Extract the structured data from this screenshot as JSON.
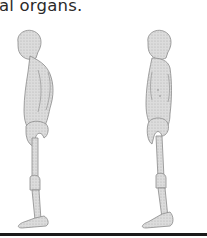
{
  "document": {
    "text_fragment": "al organs.",
    "figures": [
      {
        "id": "left",
        "description": "side-profile human figure with slumped posture"
      },
      {
        "id": "right",
        "description": "side-profile human figure with upright posture"
      }
    ],
    "colors": {
      "text": "#2a2a2a",
      "figure_fill": "#d4d4d4",
      "figure_outline": "#8a8a8a",
      "rule": "#1a1a1a"
    }
  }
}
